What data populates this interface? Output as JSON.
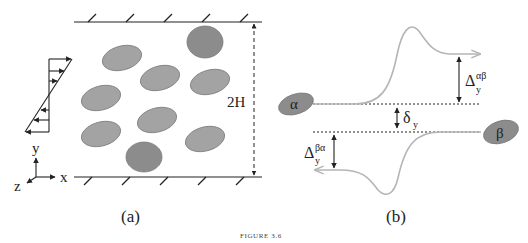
{
  "figure": {
    "caption": "FIGURE 3.6",
    "panels": [
      {
        "id": "a",
        "label": "(a)",
        "description": "Sheared suspension of particles between two parallel walls",
        "channel_height_label": "2H",
        "shear_profile": "linear",
        "axes": {
          "x": "x",
          "y": "y",
          "z": "z"
        },
        "particle_count": 9
      },
      {
        "id": "b",
        "label": "(b)",
        "description": "Pairwise particle interaction trajectories",
        "particle_alpha": "α",
        "particle_beta": "β",
        "offset_label_base": "δ",
        "offset_label_sub": "y",
        "delta_ab_base": "Δ",
        "delta_ab_sub": "y",
        "delta_ab_sup": "αβ",
        "delta_ba_base": "Δ",
        "delta_ba_sub": "y",
        "delta_ba_sup": "βα"
      }
    ],
    "colors": {
      "particle_light": "#a3a3a3",
      "particle_dark": "#8c8c8c",
      "particle_edge": "#7a7a7a",
      "trajectory": "#b5b5b5",
      "line": "#222222"
    }
  }
}
